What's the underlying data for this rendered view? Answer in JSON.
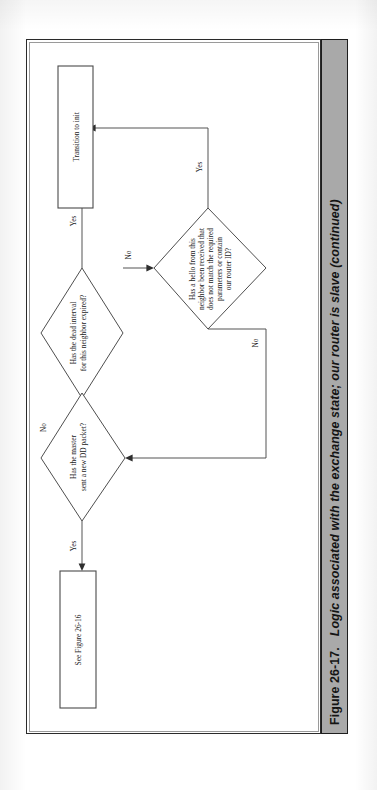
{
  "figure": {
    "number": "Figure 26-17.",
    "caption": "Logic associated with the exchange state; our router is slave (continued)"
  },
  "flowchart": {
    "nodes": [
      {
        "id": "transition-to-init",
        "type": "process",
        "label": "Transition to init"
      },
      {
        "id": "dead-interval-expired",
        "type": "decision",
        "label_lines": [
          "Has the dead interval",
          "for this neighbor expired?"
        ]
      },
      {
        "id": "hello-mismatch",
        "type": "decision",
        "label_lines": [
          "Has a hello from this",
          "neighbor been received that",
          "does not match the required",
          "parameters or contain",
          "our router ID?"
        ]
      },
      {
        "id": "master-new-dd",
        "type": "decision",
        "label_lines": [
          "Has the master",
          "sent a new DD packet?"
        ]
      },
      {
        "id": "see-figure-26-16",
        "type": "process",
        "label": "See Figure 26-16"
      }
    ],
    "edges": [
      {
        "id": "edge-dead-yes",
        "from": "dead-interval-expired",
        "to": "transition-to-init",
        "label": "Yes"
      },
      {
        "id": "edge-dead-no",
        "from": "dead-interval-expired",
        "to": "hello-mismatch",
        "label": "No"
      },
      {
        "id": "edge-hello-yes",
        "from": "hello-mismatch",
        "to": "transition-to-init",
        "label": "Yes"
      },
      {
        "id": "edge-hello-no",
        "from": "hello-mismatch",
        "to": "master-new-dd",
        "label": "No"
      },
      {
        "id": "edge-master-yes",
        "from": "master-new-dd",
        "to": "see-figure-26-16",
        "label": "Yes"
      },
      {
        "id": "edge-into-dead",
        "from": "",
        "to": "dead-interval-expired",
        "label": "No"
      }
    ]
  },
  "colors": {
    "page_background": "#ffffff",
    "caption_band": "#a9a9a9",
    "ink": "#1b1b1b",
    "line": "#4a4a4a"
  }
}
